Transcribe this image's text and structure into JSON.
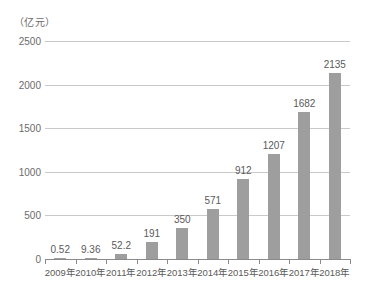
{
  "chart_data": {
    "type": "bar",
    "title": "",
    "subtitle": "",
    "unit_label": "（亿元）",
    "xlabel": "",
    "ylabel": "",
    "categories": [
      "2009年",
      "2010年",
      "2011年",
      "2012年",
      "2013年",
      "2014年",
      "2015年",
      "2016年",
      "2017年",
      "2018年"
    ],
    "values": [
      0.52,
      9.36,
      52.2,
      191,
      350,
      571,
      912,
      1207,
      1682,
      2135
    ],
    "value_labels": [
      "0.52",
      "9.36",
      "52.2",
      "191",
      "350",
      "571",
      "912",
      "1207",
      "1682",
      "2135"
    ],
    "ylim": [
      0,
      2500
    ],
    "yticks": [
      0,
      500,
      1000,
      1500,
      2000,
      2500
    ],
    "ytick_labels": [
      "0",
      "500",
      "1000",
      "1500",
      "2000",
      "2500"
    ],
    "grid": true,
    "legend": null,
    "series": [
      {
        "name": "",
        "values": [
          0.52,
          9.36,
          52.2,
          191,
          350,
          571,
          912,
          1207,
          1682,
          2135
        ]
      }
    ],
    "colors": {
      "bar": "#9e9e9e",
      "gridline": "#c9c9c9",
      "axis": "#8a8a8a",
      "text": "#5a5a5a",
      "background": "#ffffff"
    }
  }
}
